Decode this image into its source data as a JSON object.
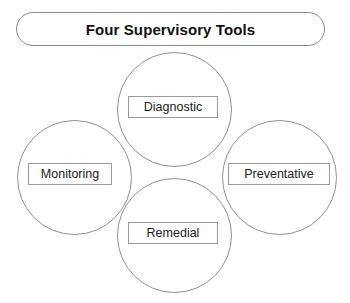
{
  "diagram": {
    "title": "Four Supervisory Tools",
    "type": "cluster-of-circles",
    "colors": {
      "background": "#ffffff",
      "outline": "#8f8f8f",
      "banner_outline": "#8a8a8a",
      "label_outline": "#9a9a9a",
      "title_text": "#111111",
      "label_text": "#1a1a1a"
    },
    "nodes": [
      {
        "id": "diagnostic",
        "label": "Diagnostic",
        "position": "top"
      },
      {
        "id": "monitoring",
        "label": "Monitoring",
        "position": "left"
      },
      {
        "id": "preventative",
        "label": "Preventative",
        "position": "right"
      },
      {
        "id": "remedial",
        "label": "Remedial",
        "position": "bottom"
      }
    ]
  }
}
